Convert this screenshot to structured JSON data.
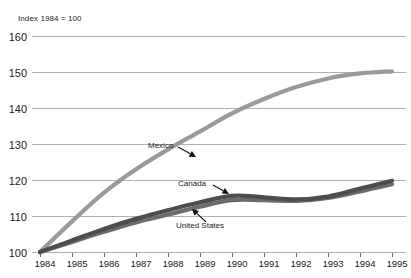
{
  "chart_data": {
    "type": "line",
    "title": "Index 1984 = 100",
    "subtitle": "",
    "xlabel": "",
    "ylabel": "",
    "x": [
      1984,
      1985,
      1986,
      1987,
      1988,
      1989,
      1990,
      1991,
      1992,
      1993,
      1994,
      1995
    ],
    "categories": [
      "1984",
      "1985",
      "1986",
      "1987",
      "1988",
      "1989",
      "1990",
      "1991",
      "1992",
      "1993",
      "1994",
      "1995"
    ],
    "xlim": [
      1984,
      1995
    ],
    "ylim": [
      100,
      160
    ],
    "yticks": [
      100,
      110,
      120,
      130,
      140,
      150,
      160
    ],
    "ytick_labels": [
      "100",
      "110",
      "120",
      "130",
      "140",
      "150",
      "160"
    ],
    "grid": true,
    "legend": "none",
    "series": [
      {
        "name": "Mexico",
        "color": "#9a9a9a",
        "values": [
          100.0,
          108.5,
          116.5,
          123.0,
          128.5,
          133.5,
          138.5,
          142.5,
          145.8,
          148.2,
          149.6,
          150.2
        ]
      },
      {
        "name": "Canada",
        "color": "#4d4d4d",
        "values": [
          100.0,
          103.2,
          106.4,
          109.2,
          111.6,
          113.8,
          115.6,
          115.2,
          114.6,
          115.4,
          117.6,
          119.8
        ]
      },
      {
        "name": "United States",
        "color": "#6b6b6b",
        "values": [
          100.0,
          102.8,
          105.6,
          108.2,
          110.4,
          112.6,
          114.4,
          114.4,
          114.2,
          115.0,
          116.8,
          118.8
        ]
      }
    ],
    "annotations": [
      {
        "text": "Mexico",
        "target_series": "Mexico",
        "label_x": 148,
        "label_y": 148,
        "arrow_from_x": 178,
        "arrow_from_y": 147,
        "arrow_to_x": 196,
        "arrow_to_y": 157
      },
      {
        "text": "Canada",
        "target_series": "Canada",
        "label_x": 178,
        "label_y": 186,
        "arrow_from_x": 213,
        "arrow_from_y": 185,
        "arrow_to_x": 229,
        "arrow_to_y": 194
      },
      {
        "text": "United States",
        "target_series": "United States",
        "label_x": 176,
        "label_y": 228,
        "arrow_from_x": 206,
        "arrow_from_y": 222,
        "arrow_to_x": 192,
        "arrow_to_y": 209
      }
    ]
  }
}
